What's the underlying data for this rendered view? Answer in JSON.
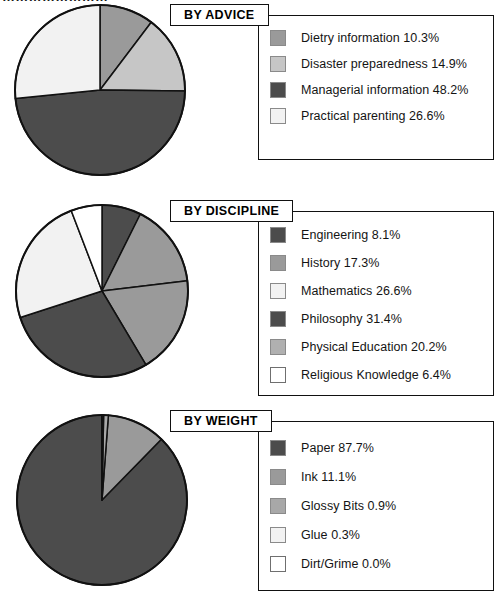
{
  "page": {
    "top_clipped_text": "……………………",
    "background": "#ffffff"
  },
  "palette": {
    "mid_gray": "#9a9a9a",
    "light_gray": "#c6c6c6",
    "dark_gray": "#4c4c4c",
    "near_white": "#f2f2f2",
    "white": "#ffffff",
    "outline": "#111111"
  },
  "sections": [
    {
      "id": "advice",
      "title": "BY ADVICE",
      "chart_data": {
        "type": "pie",
        "title": "BY ADVICE",
        "start_angle": 0,
        "direction": "clockwise",
        "categories": [
          "Dietry information",
          "Disaster preparedness",
          "Managerial information",
          "Practical parenting"
        ],
        "values": [
          10.3,
          14.9,
          48.2,
          26.6
        ],
        "unit": "%",
        "colors": [
          "#9a9a9a",
          "#c6c6c6",
          "#4c4c4c",
          "#f2f2f2"
        ],
        "legend_position": "right",
        "legend": [
          {
            "label": "Dietry information 10.3%",
            "color": "#9a9a9a",
            "value": 10.3
          },
          {
            "label": "Disaster preparedness 14.9%",
            "color": "#c6c6c6",
            "value": 14.9
          },
          {
            "label": "Managerial information 48.2%",
            "color": "#4c4c4c",
            "value": 48.2
          },
          {
            "label": "Practical parenting 26.6%",
            "color": "#f2f2f2",
            "value": 26.6
          }
        ]
      }
    },
    {
      "id": "discipline",
      "title": "BY DISCIPLINE",
      "chart_data": {
        "type": "pie",
        "title": "BY DISCIPLINE",
        "start_angle": 0,
        "direction": "clockwise",
        "categories": [
          "Engineering",
          "History",
          "Physical Education",
          "Philosophy",
          "Mathematics",
          "Religious Knowledge"
        ],
        "values": [
          8.1,
          17.3,
          20.2,
          31.4,
          26.6,
          6.4
        ],
        "unit": "%",
        "colors": [
          "#4c4c4c",
          "#9a9a9a",
          "#9a9a9a",
          "#4c4c4c",
          "#f2f2f2",
          "#ffffff"
        ],
        "legend_position": "right",
        "legend": [
          {
            "label": "Engineering 8.1%",
            "color": "#4c4c4c",
            "value": 8.1
          },
          {
            "label": "History 17.3%",
            "color": "#9a9a9a",
            "value": 17.3
          },
          {
            "label": "Mathematics 26.6%",
            "color": "#f2f2f2",
            "value": 26.6
          },
          {
            "label": "Philosophy 31.4%",
            "color": "#4c4c4c",
            "value": 31.4
          },
          {
            "label": "Physical Education 20.2%",
            "color": "#b0b0b0",
            "value": 20.2
          },
          {
            "label": "Religious Knowledge 6.4%",
            "color": "#ffffff",
            "value": 6.4
          }
        ]
      }
    },
    {
      "id": "weight",
      "title": "BY WEIGHT",
      "chart_data": {
        "type": "pie",
        "title": "BY WEIGHT",
        "start_angle": 0,
        "direction": "counterclockwise",
        "categories": [
          "Paper",
          "Ink",
          "Glossy Bits",
          "Glue",
          "Dirt/Grime"
        ],
        "values": [
          87.7,
          11.1,
          0.9,
          0.3,
          0.0
        ],
        "unit": "%",
        "colors": [
          "#4c4c4c",
          "#9a9a9a",
          "#a8a8a8",
          "#f2f2f2",
          "#ffffff"
        ],
        "legend_position": "right",
        "legend": [
          {
            "label": "Paper 87.7%",
            "color": "#4c4c4c",
            "value": 87.7
          },
          {
            "label": "Ink 11.1%",
            "color": "#9a9a9a",
            "value": 11.1
          },
          {
            "label": "Glossy Bits 0.9%",
            "color": "#a8a8a8",
            "value": 0.9
          },
          {
            "label": "Glue 0.3%",
            "color": "#f2f2f2",
            "value": 0.3
          },
          {
            "label": "Dirt/Grime 0.0%",
            "color": "#ffffff",
            "value": 0.0
          }
        ]
      }
    }
  ]
}
